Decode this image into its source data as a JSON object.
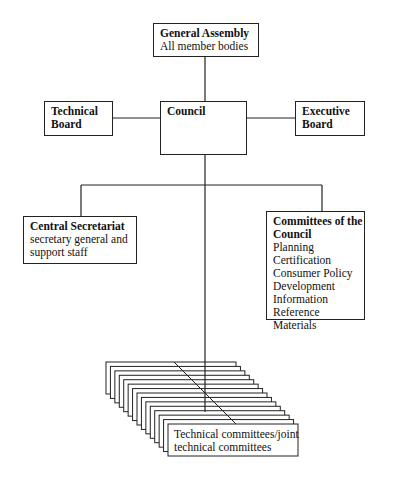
{
  "diagram": {
    "type": "organizational-chart",
    "nodes": {
      "general_assembly": {
        "title": "General Assembly",
        "subtitle": "All member bodies"
      },
      "technical_board": {
        "title_line1": "Technical",
        "title_line2": "Board"
      },
      "council": {
        "title": "Council"
      },
      "executive_board": {
        "title_line1": "Executive",
        "title_line2": "Board"
      },
      "central_secretariat": {
        "title": "Central Secretariat",
        "lines": [
          "secretary general and",
          "support staff"
        ]
      },
      "committees_of_council": {
        "title_line1": "Committees of the",
        "title_line2": "Council",
        "items": [
          "Planning",
          "Certification",
          "Consumer Policy",
          "Development",
          "Information",
          "Reference Materials"
        ]
      },
      "technical_committees": {
        "lines": [
          "Technical committees/joint",
          "technical committees"
        ]
      }
    },
    "edges": [
      [
        "general_assembly",
        "council"
      ],
      [
        "technical_board",
        "council"
      ],
      [
        "executive_board",
        "council"
      ],
      [
        "council",
        "central_secretariat"
      ],
      [
        "council",
        "committees_of_council"
      ],
      [
        "council",
        "technical_committees"
      ]
    ]
  }
}
